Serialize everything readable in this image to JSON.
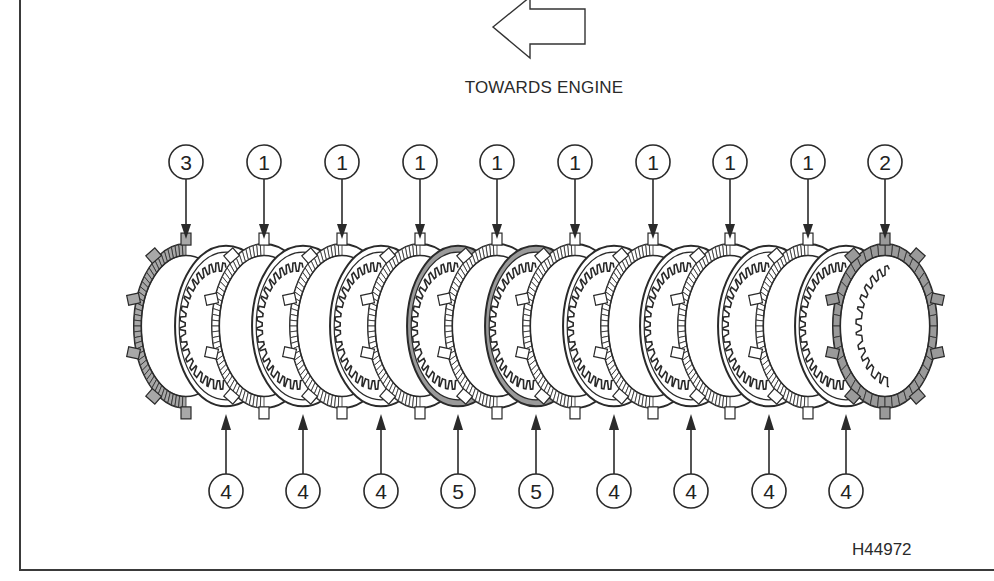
{
  "figure": {
    "direction_label": "TOWARDS ENGINE",
    "direction_arrow_icon": "left-outline-arrow",
    "figure_id": "H44972",
    "colors": {
      "line": "#2a2a2a",
      "steel_tab_fill": "#ffffff",
      "friction_fill": "#a8a8a8",
      "dark_plate_fill": "#9a9a9a",
      "background": "#ffffff"
    }
  },
  "top_callouts": [
    {
      "label": "3",
      "x": 186
    },
    {
      "label": "1",
      "x": 264
    },
    {
      "label": "1",
      "x": 342
    },
    {
      "label": "1",
      "x": 420
    },
    {
      "label": "1",
      "x": 497
    },
    {
      "label": "1",
      "x": 575
    },
    {
      "label": "1",
      "x": 653
    },
    {
      "label": "1",
      "x": 730
    },
    {
      "label": "1",
      "x": 808
    },
    {
      "label": "2",
      "x": 885
    }
  ],
  "bottom_callouts": [
    {
      "label": "4",
      "x": 226
    },
    {
      "label": "4",
      "x": 303
    },
    {
      "label": "4",
      "x": 381
    },
    {
      "label": "5",
      "x": 458
    },
    {
      "label": "5",
      "x": 536
    },
    {
      "label": "4",
      "x": 614
    },
    {
      "label": "4",
      "x": 691
    },
    {
      "label": "4",
      "x": 769
    },
    {
      "label": "4",
      "x": 846
    }
  ],
  "plates": [
    {
      "type": "end-plate",
      "x": 186
    },
    {
      "type": "friction",
      "x": 226
    },
    {
      "type": "steel",
      "x": 264
    },
    {
      "type": "friction",
      "x": 303
    },
    {
      "type": "steel",
      "x": 342
    },
    {
      "type": "friction",
      "x": 381
    },
    {
      "type": "steel",
      "x": 420
    },
    {
      "type": "friction-shaded",
      "x": 458
    },
    {
      "type": "steel",
      "x": 497
    },
    {
      "type": "friction-shaded",
      "x": 536
    },
    {
      "type": "steel",
      "x": 575
    },
    {
      "type": "friction",
      "x": 614
    },
    {
      "type": "steel",
      "x": 653
    },
    {
      "type": "friction",
      "x": 691
    },
    {
      "type": "steel",
      "x": 730
    },
    {
      "type": "friction",
      "x": 769
    },
    {
      "type": "steel",
      "x": 808
    },
    {
      "type": "friction",
      "x": 846
    },
    {
      "type": "pressure-plate",
      "x": 885
    }
  ]
}
